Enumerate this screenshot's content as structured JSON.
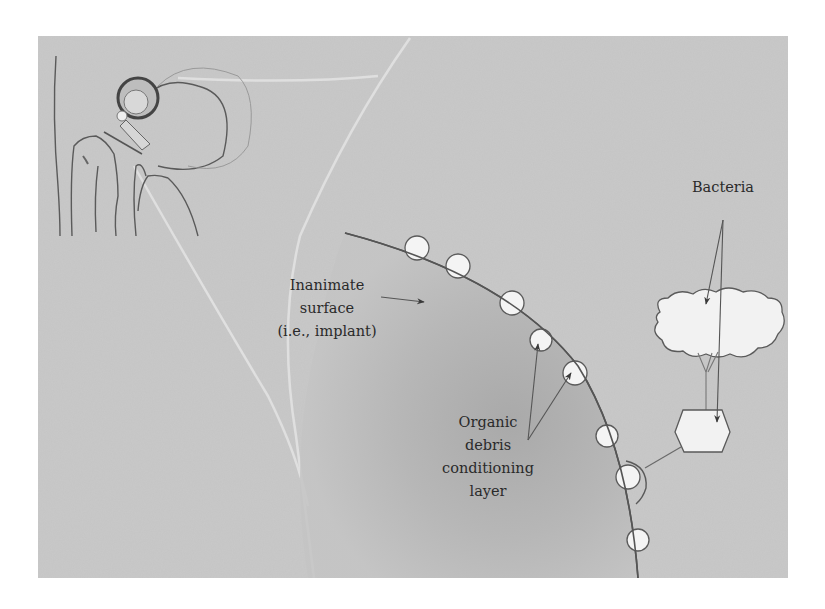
{
  "figure": {
    "colors": {
      "background": "#c9c9c9",
      "implant_shade": "#a9a9a9",
      "outline": "#555555",
      "bacteria_fill": "#f4f4f4",
      "text": "#2a2a2a"
    }
  },
  "labels": {
    "inanimate_surface": {
      "lines": [
        "Inanimate",
        "surface",
        "(i.e., implant)"
      ]
    },
    "organic_debris": {
      "lines": [
        "Organic",
        "debris",
        "conditioning",
        "layer"
      ]
    },
    "bacteria": {
      "text": "Bacteria"
    }
  },
  "elements": {
    "inset": "hip-joint-implant-illustration",
    "surface_bacteria_count": 8,
    "free_bacteria": [
      "cloud-shaped-bacterial-cluster",
      "hexagonal-bacterium"
    ]
  }
}
